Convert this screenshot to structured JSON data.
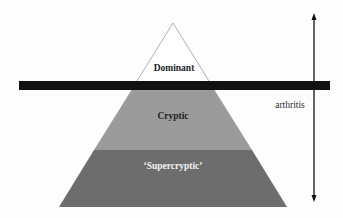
{
  "diagram": {
    "type": "iceberg-pyramid",
    "layers": [
      {
        "name": "dominant",
        "label": "Dominant",
        "fill": "#ffffff",
        "text_color": "#1e1e1e",
        "position": "above threshold"
      },
      {
        "name": "cryptic",
        "label": "Cryptic",
        "fill": "#9a9a9a",
        "text_color": "#1e1e1e",
        "position": "below threshold"
      },
      {
        "name": "supercryptic",
        "label": "‘Supercryptic’",
        "fill": "#6e6e6e",
        "text_color": "#f2f2f2",
        "position": "bottom"
      }
    ],
    "threshold_bar": {
      "color": "#111111"
    },
    "axis": {
      "label": "arthritis",
      "direction": "bidirectional-vertical",
      "color": "#111111"
    }
  }
}
